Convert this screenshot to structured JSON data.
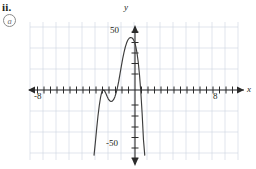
{
  "figure": {
    "item_number": "ii.",
    "part_label": "a",
    "part_label_icon": "circled-letter"
  },
  "colors": {
    "ink": "#231f20",
    "axis": "#2b2b2b",
    "grid": "#cfd3e0",
    "curve": "#3d3d3d",
    "label_gray": "#6f6f6f"
  },
  "chart_data": {
    "type": "line",
    "title": "",
    "xlabel": "x",
    "ylabel": "y",
    "xlim": [
      -10,
      10
    ],
    "ylim": [
      -62,
      62
    ],
    "xticks": [
      -9,
      -8,
      -7,
      -6,
      -5,
      -4,
      -3,
      -2,
      -1,
      1,
      2,
      3,
      4,
      5,
      6,
      7,
      8,
      9
    ],
    "yticks": [
      -60,
      -50,
      -40,
      -30,
      -20,
      -10,
      10,
      20,
      30,
      40,
      50
    ],
    "xtick_labels": [
      "-8",
      "8"
    ],
    "xtick_label_values": [
      -8,
      8
    ],
    "ytick_labels": [
      "50",
      "-50"
    ],
    "ytick_label_values": [
      50,
      -50
    ],
    "grid": true,
    "grid_x_step": 2,
    "grid_y_step": 20,
    "legend": "none",
    "annotations": [],
    "series": [
      {
        "name": "quartic",
        "description": "quartic polynomial, opens downward; double root (touch point) near x = -5, local minimum near x = -3 at y = -10, local maximum near x = 0 at y = 50, crosses x-axis near x = 1",
        "x": [
          -6.3,
          -6.1,
          -5.9,
          -5.7,
          -5.5,
          -5.3,
          -5.1,
          -4.9,
          -4.7,
          -4.5,
          -4.3,
          -4.1,
          -3.9,
          -3.7,
          -3.5,
          -3.3,
          -3.1,
          -2.9,
          -2.7,
          -2.5,
          -2.3,
          -2.1,
          -1.9,
          -1.7,
          -1.5,
          -1.3,
          -1.1,
          -0.9,
          -0.7,
          -0.5,
          -0.3,
          -0.1,
          0.1,
          0.3,
          0.5,
          0.7,
          0.9,
          1.1,
          1.3,
          1.5
        ],
        "y": [
          -62.0,
          -50.0,
          -37.0,
          -25.0,
          -15.0,
          -7.0,
          -1.5,
          0.0,
          -0.6,
          -3.0,
          -6.0,
          -8.6,
          -10.2,
          -10.9,
          -10.6,
          -9.2,
          -6.6,
          -2.8,
          2.2,
          8.4,
          15.6,
          22.8,
          29.6,
          35.6,
          40.7,
          44.7,
          47.6,
          49.3,
          50.0,
          49.8,
          48.6,
          46.2,
          42.0,
          35.6,
          26.4,
          13.8,
          -2.4,
          -22.6,
          -47.2,
          -62.0
        ]
      }
    ]
  },
  "axis_arrows": {
    "x_positive": "arrow-right",
    "x_negative": "arrow-left",
    "y_positive": "arrow-up",
    "y_negative": "arrow-down"
  }
}
